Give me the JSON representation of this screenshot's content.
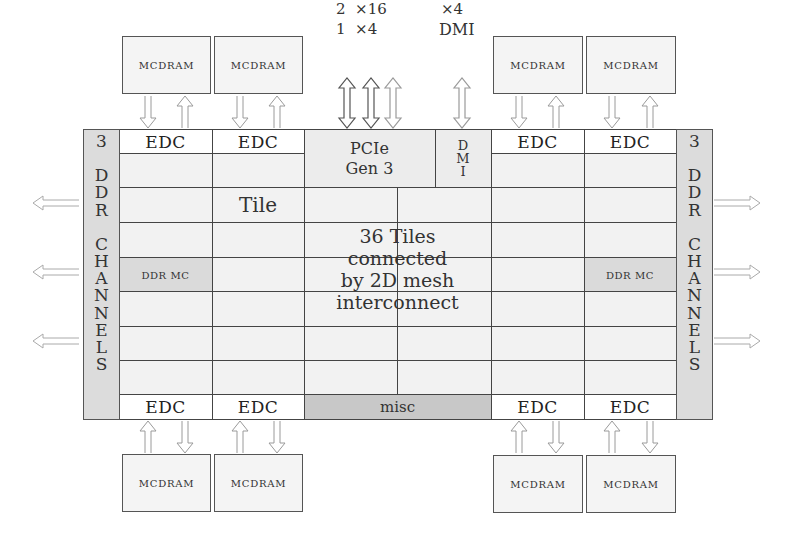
{
  "diagram": {
    "top_labels": {
      "pcie_lanes_line1": "2  ×16",
      "pcie_lanes_line2": "1  ×4",
      "dmi_lanes_line1": "×4",
      "dmi_lanes_line2": "DMI"
    },
    "mcdram": {
      "top": [
        "MCDRAM",
        "MCDRAM",
        "MCDRAM",
        "MCDRAM"
      ],
      "bottom": [
        "MCDRAM",
        "MCDRAM",
        "MCDRAM",
        "MCDRAM"
      ]
    },
    "edc": {
      "top": [
        "EDC",
        "EDC",
        "EDC",
        "EDC"
      ],
      "bottom": [
        "EDC",
        "EDC",
        "EDC",
        "EDC"
      ]
    },
    "pcie": {
      "line1": "PCIe",
      "line2": "Gen 3"
    },
    "dmi_block": {
      "letters": [
        "D",
        "M",
        "I"
      ]
    },
    "ddr_channels": {
      "left": [
        "3",
        "",
        "D",
        "D",
        "R",
        "",
        "C",
        "H",
        "A",
        "N",
        "N",
        "E",
        "L",
        "S"
      ],
      "right": [
        "3",
        "",
        "D",
        "D",
        "R",
        "",
        "C",
        "H",
        "A",
        "N",
        "N",
        "E",
        "L",
        "S"
      ],
      "count_label": "3 DDR CHANNELS"
    },
    "ddr_mc": {
      "left": "DDR MC",
      "right": "DDR MC"
    },
    "tile_label": "Tile",
    "center_text": {
      "line1": "36 Tiles",
      "line2": "connected",
      "line3": "by 2D mesh",
      "line4": "interconnect"
    },
    "misc_label": "misc",
    "colors": {
      "frame_border": "#444444",
      "tile_bg": "#f2f2f2",
      "ddr_column_bg": "#dcdcdc",
      "ddr_mc_bg": "#dadada",
      "misc_bg": "#c8c8c8",
      "edc_bg": "#ffffff",
      "arrow_stroke": "#9a9a9a"
    }
  }
}
